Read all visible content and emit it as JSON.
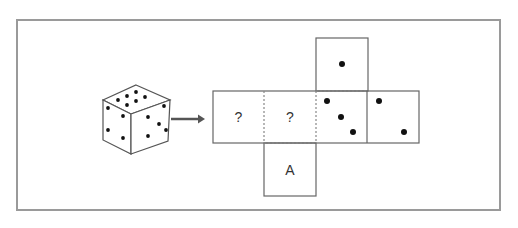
{
  "puzzle": {
    "cube": {
      "top_face_dots": 6,
      "left_face_dots": 4,
      "right_face_dots": 5
    },
    "arrow": "right-arrow",
    "net": {
      "faces": [
        {
          "id": "top",
          "content": "dots",
          "dots": 1
        },
        {
          "id": "row-1",
          "content": "label",
          "label": "?"
        },
        {
          "id": "row-2",
          "content": "label",
          "label": "?"
        },
        {
          "id": "row-3",
          "content": "dots",
          "dots": 3
        },
        {
          "id": "row-4",
          "content": "dots",
          "dots": 2
        },
        {
          "id": "bottom",
          "content": "label",
          "label": "A"
        }
      ]
    }
  },
  "colors": {
    "stroke": "#555555",
    "dot": "#111111",
    "arrow": "#555555",
    "frame": "#9a9a9a"
  }
}
